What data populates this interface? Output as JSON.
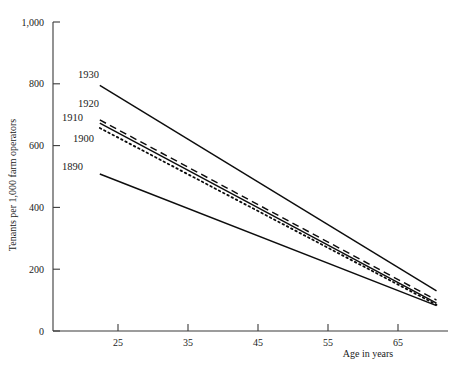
{
  "chart_data": {
    "type": "line",
    "title": "",
    "xlabel": "Age in years",
    "ylabel": "Tenants per 1,000 farm operators",
    "xlim": [
      21,
      72
    ],
    "ylim": [
      0,
      1000
    ],
    "xticks": [
      "25",
      "35",
      "45",
      "55",
      "65"
    ],
    "xtick_values": [
      25,
      35,
      45,
      55,
      65
    ],
    "yticks": [
      "0",
      "200",
      "400",
      "600",
      "800",
      "1,000"
    ],
    "ytick_values": [
      0,
      200,
      400,
      600,
      800,
      1000
    ],
    "grid": false,
    "legend": "inline-labels-left",
    "series": [
      {
        "name": "1930",
        "style": "solid",
        "label": "1930",
        "x": [
          22.4,
          70.5
        ],
        "values": [
          795,
          130
        ]
      },
      {
        "name": "1920",
        "style": "dashed",
        "label": "1920",
        "x": [
          22.4,
          70.5
        ],
        "values": [
          683,
          100
        ]
      },
      {
        "name": "1910",
        "style": "solid",
        "label": "1910",
        "x": [
          22.4,
          70.5
        ],
        "values": [
          673,
          90
        ]
      },
      {
        "name": "1900",
        "style": "dotted",
        "label": "1900",
        "x": [
          22.4,
          70.5
        ],
        "values": [
          657,
          85
        ]
      },
      {
        "name": "1890",
        "style": "solid",
        "label": "1890",
        "x": [
          22.4,
          70.5
        ],
        "values": [
          508,
          82
        ]
      }
    ],
    "series_label_positions": [
      {
        "name": "1930",
        "x": 78,
        "y": 78
      },
      {
        "name": "1920",
        "x": 78,
        "y": 107
      },
      {
        "name": "1910",
        "x": 62,
        "y": 121
      },
      {
        "name": "1900",
        "x": 73,
        "y": 142
      },
      {
        "name": "1890",
        "x": 62,
        "y": 170
      }
    ]
  },
  "axis": {
    "x_title": "Age in years",
    "y_title": "Tenants per 1,000 farm operators"
  }
}
